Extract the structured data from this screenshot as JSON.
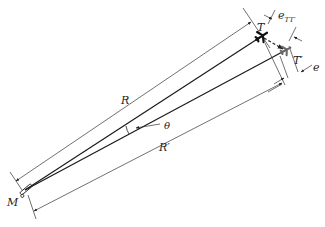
{
  "diagram": {
    "type": "geometry-error-diagram",
    "labels": {
      "R": "R",
      "R_prime": "R′",
      "theta": "θ",
      "T": "T",
      "T_prime": "T′",
      "e": "e",
      "e_TT_base": "e",
      "e_TT_sub": "TT′",
      "M": "M"
    },
    "colors": {
      "line": "#1a1a1a",
      "dim_line": "#333333",
      "target": "#111111",
      "target_prime": "#666666",
      "background": "#ffffff"
    },
    "points": {
      "M": [
        25,
        190
      ],
      "T": [
        262,
        36
      ],
      "T_prime": [
        286,
        50
      ]
    }
  }
}
